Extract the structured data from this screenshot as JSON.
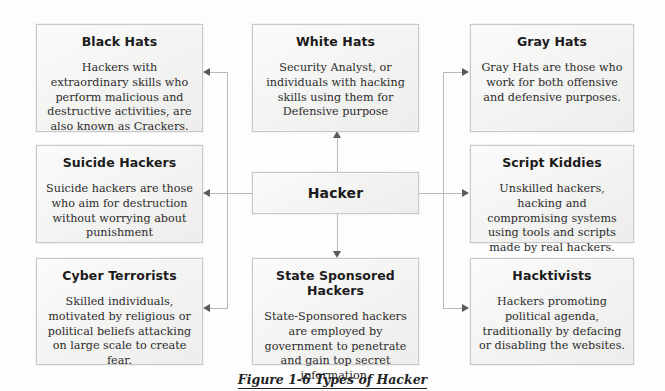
{
  "figure": {
    "caption": "Figure 1-6 Types of Hacker",
    "center_node": {
      "title": "Hacker"
    },
    "nodes": [
      {
        "id": "black-hats",
        "title": "Black Hats",
        "desc": "Hackers with extraordinary skills who perform malicious and destructive activities, are also known as Crackers."
      },
      {
        "id": "suicide-hackers",
        "title": "Suicide Hackers",
        "desc": "Suicide hackers are those who aim for destruction without worrying about punishment"
      },
      {
        "id": "cyber-terrorists",
        "title": "Cyber Terrorists",
        "desc": "Skilled individuals, motivated by religious or political beliefs attacking on large scale to create fear."
      },
      {
        "id": "white-hats",
        "title": "White Hats",
        "desc": "Security Analyst, or individuals with hacking skills using them for Defensive purpose"
      },
      {
        "id": "state-sponsored-hackers",
        "title": "State Sponsored Hackers",
        "desc": "State-Sponsored hackers are employed by government to penetrate and gain top secret information."
      },
      {
        "id": "gray-hats",
        "title": "Gray Hats",
        "desc": "Gray Hats are those who work for both offensive and defensive purposes."
      },
      {
        "id": "script-kiddies",
        "title": "Script Kiddies",
        "desc": "Unskilled hackers, hacking and compromising systems using tools and scripts made by real hackers."
      },
      {
        "id": "hacktivists",
        "title": "Hacktivists",
        "desc": "Hackers promoting political agenda, traditionally by defacing or disabling the websites."
      }
    ],
    "colors": {
      "box_border": "#c9c9c9",
      "box_fill": "#f4f4f2",
      "connector": "#b9b9b9",
      "arrow": "#5a5a5a",
      "text": "#1b1b1b",
      "background": "#fdfdfd"
    }
  }
}
